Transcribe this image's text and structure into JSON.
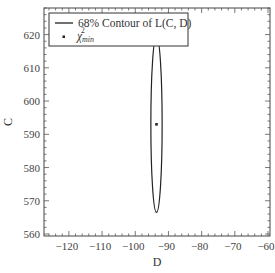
{
  "chart_data": {
    "type": "line",
    "title": "",
    "xlabel": "D",
    "ylabel": "C",
    "xlim": [
      -127.5,
      -59.4
    ],
    "ylim": [
      559.4,
      628.0
    ],
    "xticks": [
      -120,
      -110,
      -100,
      -90,
      -80,
      -70,
      -60
    ],
    "yticks": [
      560,
      570,
      580,
      590,
      600,
      610,
      620
    ],
    "xtick_labels": [
      "−120",
      "−110",
      "−100",
      "−90",
      "−80",
      "−70",
      "−60"
    ],
    "ytick_labels": [
      "560",
      "570",
      "580",
      "590",
      "600",
      "610",
      "620"
    ],
    "minor_ticks_per_major": 5,
    "grid": false,
    "legend_position": "upper left",
    "series": [
      {
        "name": "68% Contour of L(C, D)",
        "kind": "ellipse-contour",
        "center": {
          "D": -93.6,
          "C": 593.0
        },
        "half_width_D": 1.7,
        "half_height_C": 26.5,
        "color": "#222222"
      },
      {
        "name": "χ²_min",
        "kind": "marker",
        "points": [
          {
            "D": -93.6,
            "C": 593.0
          }
        ],
        "color": "#222222"
      }
    ]
  },
  "legend": {
    "items": [
      {
        "label": "68% Contour of L(C, D)"
      },
      {
        "label_main": "χ",
        "label_sup": "2",
        "label_sub": "min"
      }
    ]
  },
  "axes": {
    "xlabel": "D",
    "ylabel": "C"
  }
}
